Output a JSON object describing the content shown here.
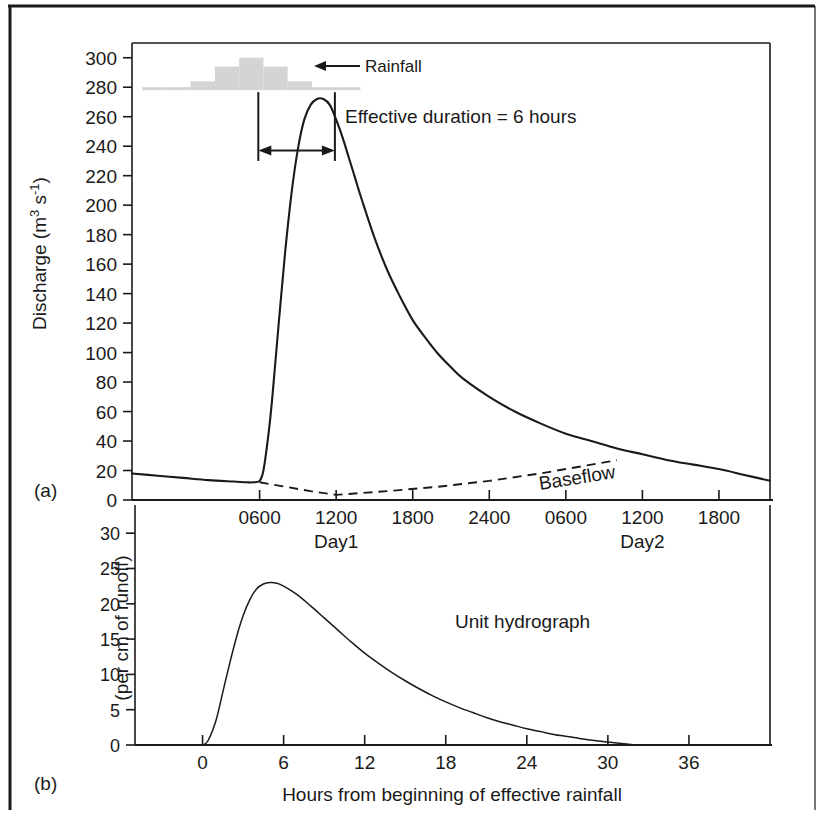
{
  "figure": {
    "panel_a_letter": "(a)",
    "panel_b_letter": "(b)",
    "border_color": "#1a1a1a",
    "curve_color": "#1a1a1a",
    "rainfall_bar_color": "#d4d4d4"
  },
  "chart_data": [
    {
      "type": "line",
      "id": "panel-a-storm-hydrograph",
      "title": "",
      "xlabel": "",
      "ylabel": "Discharge (m3 s-1)",
      "ylabel_display": "Discharge (m",
      "ylabel_sup1": "3",
      "ylabel_mid": " s",
      "ylabel_sup2": "-1",
      "ylabel_end": ")",
      "ylim": [
        0,
        310
      ],
      "yticks": [
        0,
        20,
        40,
        60,
        80,
        100,
        120,
        140,
        160,
        180,
        200,
        220,
        240,
        260,
        280,
        300
      ],
      "ytick_labels": [
        "0",
        "20",
        "40",
        "60",
        "80",
        "100",
        "120",
        "140",
        "160",
        "180",
        "200",
        "220",
        "240",
        "260",
        "280",
        "300"
      ],
      "xlim_hours": [
        -4,
        46
      ],
      "xticks_hours": [
        6,
        12,
        18,
        24,
        30,
        36,
        42
      ],
      "xtick_labels": [
        "0600",
        "1200",
        "1800",
        "2400",
        "0600",
        "1200",
        "1800"
      ],
      "day_labels": [
        {
          "text": "Day1",
          "at_hour": 12
        },
        {
          "text": "Day2",
          "at_hour": 36
        }
      ],
      "grid": false,
      "legend": "none",
      "series": [
        {
          "name": "Storm hydrograph",
          "style": "solid",
          "x": [
            -4,
            -2,
            0,
            2,
            4,
            5,
            5.5,
            6,
            6.3,
            6.7,
            7,
            7.5,
            8,
            8.5,
            9,
            9.5,
            10,
            10.5,
            11,
            11.5,
            12,
            12.5,
            13,
            13.5,
            14,
            15,
            16,
            17,
            18,
            19,
            20,
            21,
            22,
            24,
            26,
            28,
            30,
            32,
            34,
            36,
            38,
            40,
            42,
            44,
            46
          ],
          "y": [
            18,
            16.5,
            15,
            13.5,
            12.5,
            12,
            12,
            13,
            20,
            45,
            70,
            120,
            168,
            208,
            238,
            258,
            268,
            272,
            272,
            268,
            258,
            246,
            232,
            218,
            204,
            178,
            156,
            138,
            122,
            110,
            99,
            90,
            82,
            70,
            60,
            52,
            45,
            40,
            35,
            31,
            27,
            24,
            21,
            17,
            13
          ]
        },
        {
          "name": "Baseflow",
          "style": "dashed",
          "label": "Baseflow",
          "x": [
            6,
            8,
            10,
            12,
            16,
            20,
            24,
            28,
            32,
            34
          ],
          "y": [
            12,
            9,
            6,
            3.5,
            6,
            9,
            13,
            18,
            24,
            27
          ]
        }
      ],
      "annotations": [
        {
          "text": "Rainfall",
          "kind": "arrow-label",
          "points_to": "rainfall-histogram"
        },
        {
          "text": "Effective duration = 6 hours",
          "kind": "text"
        },
        {
          "text": "Baseflow",
          "kind": "curve-label"
        }
      ],
      "rainfall_histogram": {
        "label": "Rainfall",
        "baseline_discharge": 278,
        "bar_values": [
          2,
          2,
          6,
          16,
          22,
          16,
          6,
          2,
          2
        ],
        "bar_start_hour": -3.2,
        "bar_width_hours": 1.9
      },
      "effective_duration": {
        "label": "Effective duration = 6 hours",
        "start_hour": 5.9,
        "end_hour": 11.9,
        "hours": 6
      }
    },
    {
      "type": "line",
      "id": "panel-b-unit-hydrograph",
      "title": "",
      "xlabel": "Hours from beginning of effective rainfall",
      "ylabel": "(per cm of runoff)",
      "ylim": [
        0,
        33
      ],
      "yticks": [
        0,
        5,
        10,
        15,
        20,
        25,
        30
      ],
      "ytick_labels": [
        "0",
        "5",
        "10",
        "15",
        "20",
        "25",
        "30"
      ],
      "xlim": [
        -5,
        42
      ],
      "xticks": [
        0,
        6,
        12,
        18,
        24,
        30,
        36
      ],
      "xtick_labels": [
        "0",
        "6",
        "12",
        "18",
        "24",
        "30",
        "36"
      ],
      "grid": false,
      "legend": "none",
      "series": [
        {
          "name": "Unit hydrograph",
          "style": "solid",
          "label": "Unit hydrograph",
          "x": [
            0,
            0.4,
            1,
            1.5,
            2,
            2.5,
            3,
            3.5,
            4,
            4.5,
            5,
            5.5,
            6,
            7,
            8,
            9,
            10,
            11,
            12,
            13,
            14,
            15,
            16,
            17,
            18,
            19,
            20,
            21,
            22,
            23,
            24,
            25,
            26,
            27,
            28,
            29,
            30,
            31,
            32
          ],
          "y": [
            0,
            0.6,
            3.5,
            7.5,
            11.5,
            15.2,
            18.3,
            20.6,
            22.1,
            22.8,
            23.0,
            22.9,
            22.5,
            21.3,
            19.7,
            18.0,
            16.3,
            14.6,
            13.0,
            11.6,
            10.3,
            9.1,
            8.0,
            7.0,
            6.1,
            5.3,
            4.6,
            3.9,
            3.3,
            2.8,
            2.3,
            1.9,
            1.5,
            1.2,
            0.9,
            0.65,
            0.42,
            0.2,
            0
          ]
        }
      ],
      "annotations": [
        {
          "text": "Unit hydrograph",
          "kind": "curve-label"
        }
      ]
    }
  ]
}
